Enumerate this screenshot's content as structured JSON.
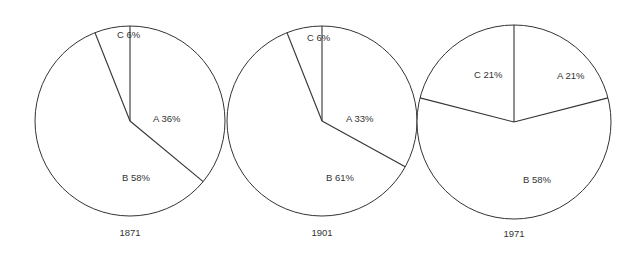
{
  "chart_data": [
    {
      "type": "pie",
      "title": "1871",
      "categories": [
        "A",
        "B",
        "C"
      ],
      "values": [
        36,
        58,
        6
      ],
      "labels": [
        "A 36%",
        "B 58%",
        "C 6%"
      ],
      "start_angle": "12 o'clock, clockwise",
      "legend": "none (inline labels)"
    },
    {
      "type": "pie",
      "title": "1901",
      "categories": [
        "A",
        "B",
        "C"
      ],
      "values": [
        33,
        61,
        6
      ],
      "labels": [
        "A 33%",
        "B 61%",
        "C 6%"
      ],
      "start_angle": "12 o'clock, clockwise",
      "legend": "none (inline labels)"
    },
    {
      "type": "pie",
      "title": "1971",
      "categories": [
        "A",
        "B",
        "C"
      ],
      "values": [
        21,
        58,
        21
      ],
      "labels": [
        "A 21%",
        "B 58%",
        "C 21%"
      ],
      "start_angle": "12 o'clock, clockwise",
      "legend": "none (inline labels)"
    }
  ],
  "style": {
    "stroke_color": "#333333",
    "fill_color": "#ffffff",
    "text_color": "#333333"
  },
  "geometry": [
    {
      "cx": 130,
      "cy": 121,
      "r": 95,
      "year_y": 236,
      "labels_pos": {
        "A": [
          153,
          122
        ],
        "B": [
          122,
          181
        ],
        "C": [
          117,
          38
        ]
      }
    },
    {
      "cx": 322,
      "cy": 121,
      "r": 95,
      "year_y": 236,
      "labels_pos": {
        "A": [
          346,
          122
        ],
        "B": [
          326,
          181
        ],
        "C": [
          307,
          41
        ]
      }
    },
    {
      "cx": 514,
      "cy": 122,
      "r": 97,
      "year_y": 237,
      "labels_pos": {
        "A": [
          557,
          79
        ],
        "B": [
          523,
          183
        ],
        "C": [
          474,
          78
        ]
      }
    }
  ]
}
